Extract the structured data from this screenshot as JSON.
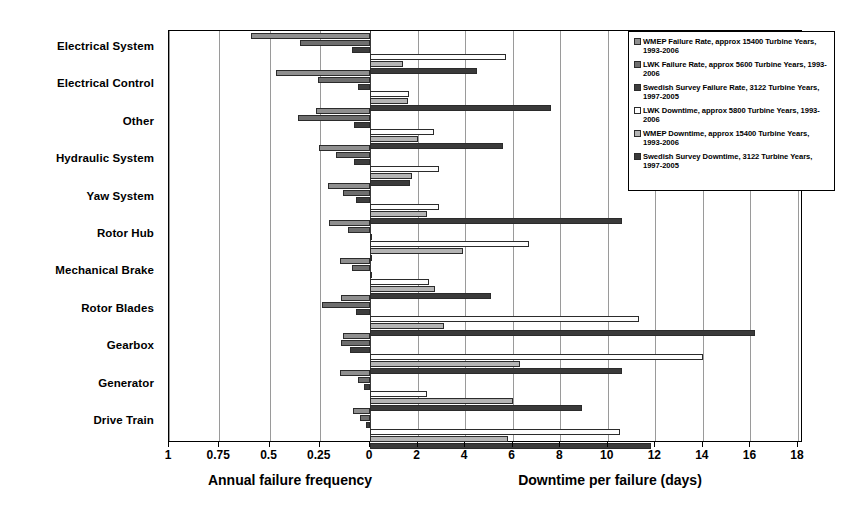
{
  "chart_data": {
    "type": "bar",
    "orientation": "horizontal-diverging",
    "title": "",
    "categories": [
      "Electrical System",
      "Electrical Control",
      "Other",
      "Hydraulic System",
      "Yaw System",
      "Rotor Hub",
      "Mechanical Brake",
      "Rotor Blades",
      "Gearbox",
      "Generator",
      "Drive Train"
    ],
    "left_axis": {
      "label": "Annual failure frequency",
      "ticks": [
        1,
        0.75,
        0.5,
        0.25,
        0
      ],
      "tick_labels": [
        "1",
        "0.75",
        "0.5",
        "0.25",
        "0"
      ],
      "range": [
        1,
        0
      ],
      "direction": "right-to-left"
    },
    "right_axis": {
      "label": "Downtime per failure (days)",
      "ticks": [
        0,
        2,
        4,
        6,
        8,
        10,
        12,
        14,
        16,
        18
      ],
      "tick_labels": [
        "0",
        "2",
        "4",
        "6",
        "8",
        "10",
        "12",
        "14",
        "16",
        "18"
      ],
      "range": [
        0,
        18
      ]
    },
    "grid": true,
    "legend_position": "top-right",
    "series": [
      {
        "name": "WMEP Failure Rate, approx 15400 Turbine Years, 1993-2006",
        "side": "left",
        "color": "#8f8f8f",
        "values": [
          0.59,
          0.47,
          0.27,
          0.255,
          0.21,
          0.205,
          0.15,
          0.145,
          0.135,
          0.15,
          0.085
        ]
      },
      {
        "name": "LWK Failure Rate, approx 5600 Turbine Years, 1993-2006",
        "side": "left",
        "color": "#6e6e6e",
        "values": [
          0.35,
          0.26,
          0.36,
          0.17,
          0.135,
          0.11,
          0.09,
          0.24,
          0.145,
          0.06,
          0.05
        ]
      },
      {
        "name": "Swedish Survey Failure Rate, 3122 Turbine Years, 1997-2005",
        "side": "left",
        "color": "#3d3d3d",
        "values": [
          0.09,
          0.06,
          0.08,
          0.08,
          0.07,
          0.0,
          0.0,
          0.07,
          0.1,
          0.03,
          0.02
        ]
      },
      {
        "name": "LWK Downtime, approx 5800 Turbine Years, 1993-2006",
        "side": "right",
        "color": "#fdfdfd",
        "values": [
          5.7,
          1.65,
          2.7,
          2.9,
          2.9,
          6.7,
          2.5,
          11.3,
          14.0,
          2.4,
          10.5
        ]
      },
      {
        "name": "WMEP Downtime, approx 15400 Turbine Years, 1993-2006",
        "side": "right",
        "color": "#b4b4b4",
        "values": [
          1.4,
          1.6,
          2.0,
          1.75,
          2.4,
          3.9,
          2.75,
          3.1,
          6.3,
          6.0,
          5.8
        ]
      },
      {
        "name": "Swedish Survey Downtime, 3122 Turbine Years, 1997-2005",
        "side": "right",
        "color": "#3a3a3a",
        "values": [
          4.5,
          7.6,
          5.6,
          1.7,
          10.6,
          0.0,
          5.1,
          16.2,
          10.6,
          8.9,
          11.8
        ]
      }
    ]
  },
  "legend": {
    "items": [
      {
        "label": "WMEP Failure Rate, approx 15400 Turbine Years, 1993-2006",
        "color": "#8f8f8f"
      },
      {
        "label": "LWK Failure Rate, approx 5600 Turbine Years, 1993-2006",
        "color": "#6e6e6e"
      },
      {
        "label": "Swedish Survey Failure Rate, 3122 Turbine Years, 1997-2005",
        "color": "#3d3d3d"
      },
      {
        "label": "LWK Downtime, approx 5800 Turbine Years, 1993-2006",
        "color": "#fdfdfd"
      },
      {
        "label": "WMEP Downtime, approx 15400 Turbine Years, 1993-2006",
        "color": "#b4b4b4"
      },
      {
        "label": "Swedish Survey Downtime, 3122 Turbine Years, 1997-2005",
        "color": "#3a3a3a"
      }
    ]
  }
}
